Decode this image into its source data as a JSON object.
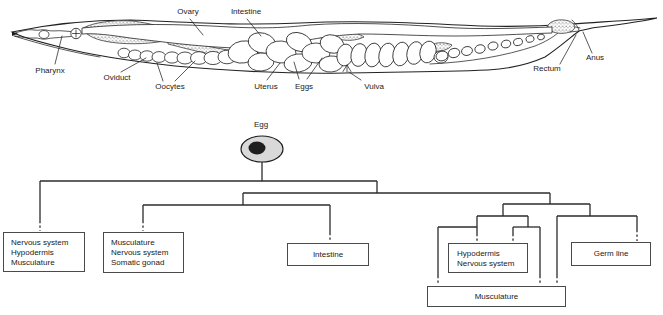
{
  "colors": {
    "ink": "#222222",
    "egg_fill": "#d9d9d9",
    "nucleus_fill": "#1f1f1f",
    "background": "#ffffff"
  },
  "anatomy": {
    "labels": {
      "pharynx": "Pharynx",
      "ovary": "Ovary",
      "intestine": "Intestine",
      "oviduct": "Oviduct",
      "oocytes": "Oocytes",
      "uterus": "Uterus",
      "eggs": "Eggs",
      "vulva": "Vulva",
      "rectum": "Rectum",
      "anus": "Anus"
    }
  },
  "lineage": {
    "root_label": "Egg",
    "boxes": [
      {
        "id": "ab",
        "lines": [
          "Nervous system",
          "Hypodermis",
          "Musculature"
        ]
      },
      {
        "id": "ms",
        "lines": [
          "Musculature",
          "Nervous system",
          "Somatic gonad"
        ]
      },
      {
        "id": "e",
        "lines": [
          "Intestine"
        ]
      },
      {
        "id": "c",
        "lines": [
          "Hypodermis",
          "Nervous system"
        ]
      },
      {
        "id": "p4",
        "lines": [
          "Germ line"
        ]
      },
      {
        "id": "d",
        "lines": [
          "Musculature"
        ]
      }
    ]
  }
}
